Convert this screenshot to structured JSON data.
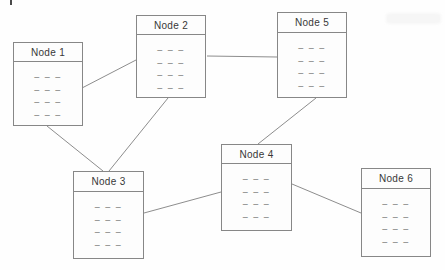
{
  "diagram": {
    "canvas": {
      "width": 445,
      "height": 270
    },
    "colors": {
      "background": "#fefefe",
      "node_fill": "#fdfdfd",
      "node_border": "#878787",
      "edge_line": "#8d8d8d",
      "title_text": "#383838",
      "dash_text": "#6d6d6d"
    },
    "nodes": [
      {
        "id": "node-1",
        "label": "Node 1",
        "x": 13,
        "y": 42,
        "w": 70,
        "h": 84,
        "title_h": 19,
        "rows": [
          "– – –",
          "– – –",
          "– – –",
          "– – –"
        ]
      },
      {
        "id": "node-2",
        "label": "Node 2",
        "x": 136,
        "y": 15,
        "w": 70,
        "h": 83,
        "title_h": 19,
        "rows": [
          "– – –",
          "– – –",
          "– – –",
          "– – –"
        ]
      },
      {
        "id": "node-3",
        "label": "Node 3",
        "x": 73,
        "y": 171,
        "w": 71,
        "h": 88,
        "title_h": 20,
        "rows": [
          "– – –",
          "– – –",
          "– – –",
          "– – –"
        ]
      },
      {
        "id": "node-4",
        "label": "Node 4",
        "x": 221,
        "y": 144,
        "w": 71,
        "h": 87,
        "title_h": 19,
        "rows": [
          "– – –",
          "– – –",
          "– – –",
          "– – –"
        ]
      },
      {
        "id": "node-5",
        "label": "Node 5",
        "x": 277,
        "y": 12,
        "w": 70,
        "h": 86,
        "title_h": 20,
        "rows": [
          "– – –",
          "– – –",
          "– – –",
          "– – –"
        ]
      },
      {
        "id": "node-6",
        "label": "Node 6",
        "x": 361,
        "y": 168,
        "w": 70,
        "h": 89,
        "title_h": 20,
        "rows": [
          "– – –",
          "– – –",
          "– – –",
          "– – –"
        ]
      }
    ],
    "edges": [
      {
        "from": "node-1",
        "to": "node-2",
        "x1": 82,
        "y1": 88,
        "x2": 136,
        "y2": 60
      },
      {
        "from": "node-2",
        "to": "node-5",
        "x1": 207,
        "y1": 56,
        "x2": 277,
        "y2": 57
      },
      {
        "from": "node-1",
        "to": "node-3",
        "x1": 47,
        "y1": 126,
        "x2": 103,
        "y2": 171
      },
      {
        "from": "node-2",
        "to": "node-3",
        "x1": 168,
        "y1": 98,
        "x2": 109,
        "y2": 171
      },
      {
        "from": "node-5",
        "to": "node-4",
        "x1": 316,
        "y1": 98,
        "x2": 258,
        "y2": 144
      },
      {
        "from": "node-3",
        "to": "node-4",
        "x1": 144,
        "y1": 213,
        "x2": 221,
        "y2": 192
      },
      {
        "from": "node-4",
        "to": "node-6",
        "x1": 292,
        "y1": 184,
        "x2": 361,
        "y2": 213
      }
    ]
  }
}
